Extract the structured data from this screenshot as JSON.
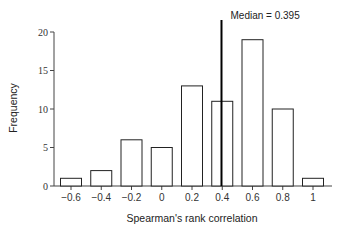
{
  "chart_data": {
    "type": "bar",
    "title": "",
    "xlabel": "Spearman's rank correlation",
    "ylabel": "Frequency",
    "categories": [
      "-0.6",
      "-0.4",
      "-0.2",
      "0",
      "0.2",
      "0.4",
      "0.6",
      "0.8",
      "1"
    ],
    "values": [
      1,
      2,
      6,
      5,
      13,
      11,
      19,
      10,
      1
    ],
    "x_tick_labels": [
      "−0.6",
      "−0.4",
      "−0.2",
      "0",
      "0.2",
      "0.4",
      "0.6",
      "0.8",
      "1"
    ],
    "y_ticks": [
      0,
      5,
      10,
      15,
      20
    ],
    "ylim": [
      0,
      20
    ],
    "xlim": [
      -0.7,
      1.1
    ],
    "grid": false,
    "legend": null,
    "annotations": [
      {
        "type": "vline",
        "x": 0.395,
        "label": "Median = 0.395"
      }
    ],
    "bar_fill": "#ffffff",
    "bar_stroke": "#222222",
    "median_line_color": "#000000"
  }
}
